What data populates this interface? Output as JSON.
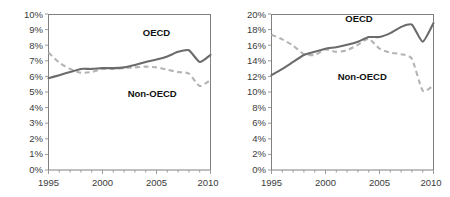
{
  "figure": {
    "background": "#ffffff",
    "panel_count": 2
  },
  "style": {
    "oecd_color": "#6b6b6b",
    "nonoecd_color": "#b4b4b4",
    "frame_color": "#808080",
    "tick_color": "#9a9a9a",
    "text_color": "#3b3b3b"
  },
  "chart_data": [
    {
      "type": "line",
      "title": "",
      "xlabel": "",
      "ylabel": "",
      "xlim": [
        1995,
        2010
      ],
      "ylim": [
        0,
        10
      ],
      "grid": false,
      "legend": "inline-annotation",
      "x": [
        1995,
        1996,
        1997,
        1998,
        1999,
        2000,
        2001,
        2002,
        2003,
        2004,
        2005,
        2006,
        2007,
        2008,
        2009,
        2010
      ],
      "xticks": [
        1995,
        2000,
        2005,
        2010
      ],
      "xtick_labels": [
        "1995",
        "2000",
        "2005",
        "2010"
      ],
      "yticks": [
        0,
        1,
        2,
        3,
        4,
        5,
        6,
        7,
        8,
        9,
        10
      ],
      "ytick_labels": [
        "0%",
        "1%",
        "2%",
        "3%",
        "4%",
        "5%",
        "6%",
        "7%",
        "8%",
        "9%",
        "10%"
      ],
      "series": [
        {
          "name": "OECD",
          "style": "solid",
          "color": "#6b6b6b",
          "label_x": 2005.0,
          "label_y": 8.6,
          "values": [
            5.9,
            6.1,
            6.3,
            6.5,
            6.5,
            6.55,
            6.55,
            6.6,
            6.75,
            6.95,
            7.1,
            7.3,
            7.6,
            7.7,
            6.95,
            7.4
          ]
        },
        {
          "name": "Non-OECD",
          "style": "dashed",
          "color": "#b4b4b4",
          "label_x": 2004.6,
          "label_y": 4.7,
          "values": [
            7.55,
            6.9,
            6.5,
            6.25,
            6.3,
            6.5,
            6.5,
            6.55,
            6.6,
            6.65,
            6.6,
            6.45,
            6.3,
            6.2,
            5.4,
            5.8
          ]
        }
      ]
    },
    {
      "type": "line",
      "title": "",
      "xlabel": "",
      "ylabel": "",
      "xlim": [
        1995,
        2010
      ],
      "ylim": [
        0,
        20
      ],
      "grid": false,
      "legend": "inline-annotation",
      "x": [
        1995,
        1996,
        1997,
        1998,
        1999,
        2000,
        2001,
        2002,
        2003,
        2004,
        2005,
        2006,
        2007,
        2008,
        2009,
        2010
      ],
      "xticks": [
        1995,
        2000,
        2005,
        2010
      ],
      "xtick_labels": [
        "1995",
        "2000",
        "2005",
        "2010"
      ],
      "yticks": [
        0,
        2,
        4,
        6,
        8,
        10,
        12,
        14,
        16,
        18,
        20
      ],
      "ytick_labels": [
        "0%",
        "2%",
        "4%",
        "6%",
        "8%",
        "10%",
        "12%",
        "14%",
        "16%",
        "18%",
        "20%"
      ],
      "series": [
        {
          "name": "OECD",
          "style": "solid",
          "color": "#6b6b6b",
          "label_x": 2003.1,
          "label_y": 19.1,
          "values": [
            12.2,
            13.0,
            13.9,
            14.8,
            15.2,
            15.6,
            15.8,
            16.1,
            16.5,
            17.1,
            17.1,
            17.6,
            18.4,
            18.7,
            16.5,
            18.9
          ]
        },
        {
          "name": "Non-OECD",
          "style": "dashed",
          "color": "#b4b4b4",
          "label_x": 2003.4,
          "label_y": 11.6,
          "values": [
            17.4,
            16.8,
            16.0,
            14.9,
            14.8,
            15.5,
            15.2,
            15.4,
            16.1,
            16.9,
            15.6,
            15.1,
            14.9,
            14.3,
            10.2,
            10.9
          ]
        }
      ]
    }
  ]
}
